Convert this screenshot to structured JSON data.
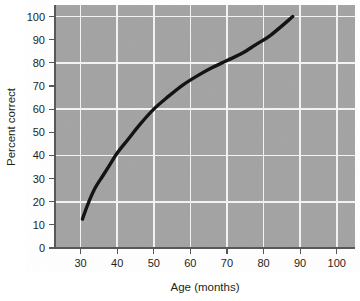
{
  "chart_data": {
    "type": "line",
    "title": "",
    "xlabel": "Age (months)",
    "ylabel": "Percent correct",
    "xlim": [
      23,
      105
    ],
    "ylim": [
      0,
      105
    ],
    "xticks": [
      30,
      40,
      50,
      60,
      70,
      80,
      90,
      100
    ],
    "yticks": [
      0,
      10,
      20,
      30,
      40,
      50,
      60,
      70,
      80,
      90,
      100
    ],
    "xtick_labels": [
      "30",
      "40",
      "50",
      "60",
      "70",
      "80",
      "90",
      "100"
    ],
    "ytick_labels": [
      "0",
      "10",
      "20",
      "30",
      "40",
      "50",
      "60",
      "70",
      "80",
      "90",
      "100"
    ],
    "grid": {
      "vertical_every": 10,
      "horizontal_every": 20,
      "vertical_values": [
        30,
        40,
        50,
        60,
        70,
        80,
        90,
        100
      ],
      "horizontal_values": [
        20,
        40,
        60,
        80,
        100
      ],
      "color": "#f2f2f2"
    },
    "legend": null,
    "legend_position": "none",
    "plot_background": "#a3a3a3",
    "series": [
      {
        "name": "Percent correct by age",
        "color": "#141414",
        "x": [
          30.5,
          32,
          34,
          36,
          38,
          40,
          43,
          46,
          50,
          54,
          58,
          62,
          66,
          70,
          74,
          78,
          82,
          88
        ],
        "y": [
          12.5,
          19,
          26,
          31,
          36,
          41,
          47,
          53,
          60,
          65.5,
          70.5,
          74.5,
          78,
          81,
          84,
          88,
          92,
          100
        ]
      }
    ]
  },
  "axes": {
    "x_axis_label": "Age (months)",
    "y_axis_label": "Percent correct"
  }
}
